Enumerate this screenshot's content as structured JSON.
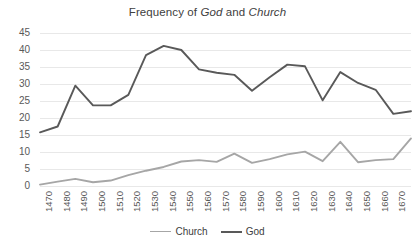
{
  "chart_data": {
    "type": "line",
    "title": "Frequency of God and Church",
    "title_parts": [
      {
        "text": "Frequency of ",
        "italic": false
      },
      {
        "text": "God",
        "italic": true
      },
      {
        "text": " and ",
        "italic": false
      },
      {
        "text": "Church",
        "italic": true
      }
    ],
    "xlabel": "",
    "ylabel": "",
    "x": [
      1470,
      1480,
      1490,
      1500,
      1510,
      1520,
      1530,
      1540,
      1550,
      1560,
      1570,
      1580,
      1590,
      1600,
      1610,
      1620,
      1630,
      1640,
      1650,
      1660,
      1670,
      1680
    ],
    "categories": [
      "1470",
      "1480",
      "1490",
      "1500",
      "1510",
      "1520",
      "1530",
      "1540",
      "1550",
      "1560",
      "1570",
      "1580",
      "1590",
      "1600",
      "1610",
      "1620",
      "1630",
      "1640",
      "1650",
      "1660",
      "1670",
      "1680"
    ],
    "xtick_labels": [
      "1470",
      "1480",
      "1490",
      "1500",
      "1510",
      "1520",
      "1530",
      "1540",
      "1550",
      "1560",
      "1570",
      "1580",
      "1590",
      "1600",
      "1610",
      "1620",
      "1630",
      "1640",
      "1650",
      "1660",
      "1670",
      "1680"
    ],
    "ytick_labels": [
      "0",
      "5",
      "10",
      "15",
      "20",
      "25",
      "30",
      "35",
      "40",
      "45"
    ],
    "yticks": [
      0,
      5,
      10,
      15,
      20,
      25,
      30,
      35,
      40,
      45
    ],
    "ylim": [
      0,
      45
    ],
    "grid": "horizontal",
    "legend_position": "bottom",
    "series": [
      {
        "name": "Church",
        "color": "#a6a6a6",
        "values": [
          0.4,
          1.3,
          2.1,
          1.1,
          1.6,
          3.2,
          4.5,
          5.6,
          7.2,
          7.6,
          7.1,
          9.5,
          6.8,
          7.9,
          9.3,
          10.1,
          7.3,
          13.0,
          7.0,
          7.6,
          7.9,
          14.0
        ]
      },
      {
        "name": "God",
        "color": "#595959",
        "values": [
          15.8,
          17.5,
          29.5,
          23.7,
          23.7,
          26.8,
          38.5,
          41.2,
          40.0,
          34.3,
          33.3,
          32.7,
          28.0,
          32.0,
          35.7,
          35.2,
          25.2,
          33.5,
          30.3,
          28.3,
          21.2,
          22.0
        ]
      }
    ]
  },
  "legend": {
    "items": [
      {
        "label": "Church",
        "color": "#a6a6a6"
      },
      {
        "label": "God",
        "color": "#595959"
      }
    ]
  },
  "colors": {
    "church_line": "#a6a6a6",
    "god_line": "#595959",
    "gridline": "#e8e8e8",
    "axis_text": "#595959",
    "title_text": "#404040",
    "background": "#ffffff"
  }
}
